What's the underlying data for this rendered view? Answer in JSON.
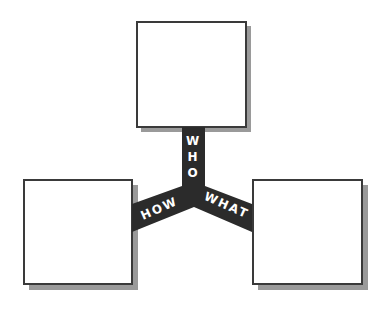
{
  "diagram": {
    "type": "three-way connector",
    "boxes": [
      {
        "id": "top",
        "position": "top-center",
        "content": ""
      },
      {
        "id": "left",
        "position": "bottom-left",
        "content": ""
      },
      {
        "id": "right",
        "position": "bottom-right",
        "content": ""
      }
    ],
    "connector": {
      "color": "#2b2b2b",
      "labels": {
        "who": [
          "W",
          "H",
          "O"
        ],
        "how": "HOW",
        "what": "WHAT"
      }
    },
    "colors": {
      "box_border": "#3a3a3a",
      "box_fill": "#ffffff",
      "shadow": "#9a9a9a",
      "label_text": "#ffffff"
    }
  }
}
